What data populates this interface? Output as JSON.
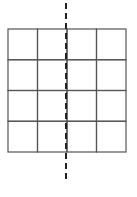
{
  "diagram": {
    "type": "grid-with-symmetry-line",
    "grid": {
      "rows": 4,
      "cols": 4,
      "x": 8,
      "y": 29,
      "width": 118,
      "height": 123,
      "stroke": "#555555"
    },
    "axis": {
      "style": "dashed",
      "x": 66,
      "y_start": 3,
      "y_end": 182,
      "stroke": "#222222"
    }
  }
}
